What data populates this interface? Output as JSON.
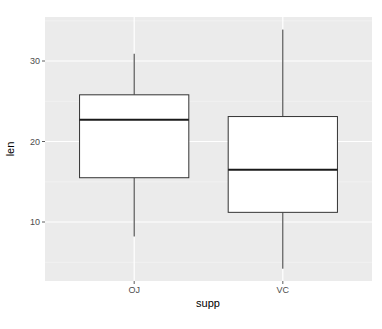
{
  "chart_data": {
    "type": "boxplot",
    "title": "",
    "xlabel": "supp",
    "ylabel": "len",
    "categories": [
      "OJ",
      "VC"
    ],
    "boxes": [
      {
        "category": "OJ",
        "whisker_low": 8.2,
        "q1": 15.5,
        "median": 22.7,
        "q3": 25.8,
        "whisker_high": 30.9
      },
      {
        "category": "VC",
        "whisker_low": 4.2,
        "q1": 11.2,
        "median": 16.5,
        "q3": 23.1,
        "whisker_high": 33.9
      }
    ],
    "y_ticks": [
      10,
      20,
      30
    ],
    "ylim": [
      2.7,
      35.5
    ],
    "grid": true,
    "legend": "none",
    "colors": {
      "panel_background": "#ebebeb",
      "grid_major": "#ffffff",
      "box_fill": "#ffffff",
      "box_line": "#333333"
    }
  },
  "axes": {
    "x_title": "supp",
    "y_title": "len",
    "x_tick_labels": [
      "OJ",
      "VC"
    ],
    "y_tick_labels": [
      "10",
      "20",
      "30"
    ]
  }
}
